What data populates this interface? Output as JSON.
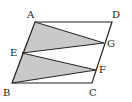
{
  "diagram": {
    "type": "geometry-parallelogram",
    "colors": {
      "stroke": "#222222",
      "fill": "#c9c9c9",
      "background": "#ffffff"
    },
    "points": {
      "A": {
        "label": "A",
        "x": 35,
        "y": 22,
        "lx": 27,
        "ly": 18
      },
      "D": {
        "label": "D",
        "x": 112,
        "y": 22,
        "lx": 112,
        "ly": 18
      },
      "E": {
        "label": "E",
        "x": 22,
        "y": 53,
        "lx": 10,
        "ly": 56
      },
      "G": {
        "label": "G",
        "x": 104,
        "y": 43,
        "lx": 107,
        "ly": 47
      },
      "B": {
        "label": "B",
        "x": 12,
        "y": 83,
        "lx": 3,
        "ly": 96
      },
      "F": {
        "label": "F",
        "x": 96,
        "y": 70,
        "lx": 99,
        "ly": 73
      },
      "C": {
        "label": "C",
        "x": 92,
        "y": 83,
        "lx": 89,
        "ly": 96
      }
    },
    "shaded_triangles": [
      [
        "A",
        "E",
        "G"
      ],
      [
        "E",
        "B",
        "F"
      ]
    ],
    "segments": [
      [
        "A",
        "D"
      ],
      [
        "D",
        "C"
      ],
      [
        "C",
        "B"
      ],
      [
        "B",
        "A"
      ],
      [
        "A",
        "G"
      ],
      [
        "E",
        "G"
      ],
      [
        "E",
        "F"
      ],
      [
        "B",
        "F"
      ]
    ]
  }
}
